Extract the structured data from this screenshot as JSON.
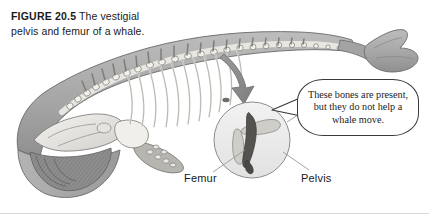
{
  "figure": {
    "number_label": "FIGURE 20.5",
    "caption_text": "The vestigial pelvis and femur of a whale."
  },
  "callout": {
    "text": "These bones are present, but they do not help a whale move."
  },
  "labels": {
    "femur": "Femur",
    "pelvis": "Pelvis"
  },
  "illustration": {
    "subject": "baleen-whale-skeleton",
    "inset": "magnified-pelvis-femur-circle",
    "arrow": "curved-arrow-to-inset",
    "colors": {
      "body_fill": "#a9a9a9",
      "body_shade": "#8d8d8d",
      "bone_light": "#f0efec",
      "bone_mid": "#c9c7c2",
      "pelvis_dark": "#55534f",
      "outline": "#5d5d5d",
      "inset_fill": "#ececec",
      "leader_line": "#8a8a8a",
      "callout_border": "#3a3a3a"
    }
  }
}
